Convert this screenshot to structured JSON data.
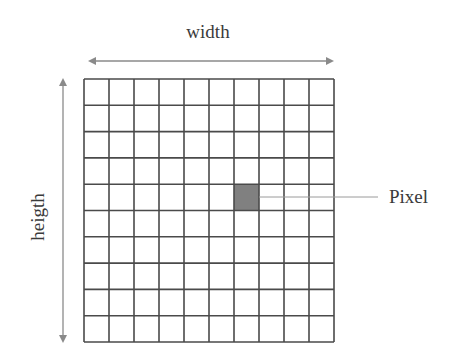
{
  "diagram": {
    "labels": {
      "width": "width",
      "height": "heigth",
      "pixel": "Pixel"
    },
    "grid": {
      "columns": 10,
      "rows": 10,
      "highlighted_cell": {
        "column": 7,
        "row": 5
      }
    },
    "colors": {
      "grid_line": "#4a4a4a",
      "arrow": "#8a8a8a",
      "pixel_fill": "#808080",
      "text": "#3a3a3a",
      "leader_line": "#9a9a9a"
    }
  }
}
